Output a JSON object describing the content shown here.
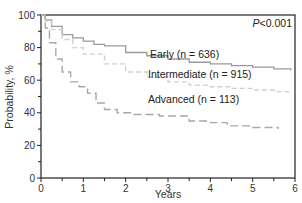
{
  "chart_data": {
    "type": "line",
    "title": "",
    "xlabel": "Years",
    "ylabel": "Probability, %",
    "xlim": [
      0,
      6
    ],
    "ylim": [
      0,
      100
    ],
    "x_ticks": [
      0,
      1,
      2,
      3,
      4,
      5,
      6
    ],
    "y_ticks": [
      0,
      20,
      40,
      60,
      80,
      100
    ],
    "grid": false,
    "annotation": "P<0.001",
    "series": [
      {
        "name": "Early (n = 636)",
        "label": "Early (n = 636)",
        "style": "solid",
        "color": "#9a9a9a",
        "x": [
          0,
          0.1,
          0.25,
          0.5,
          0.75,
          1.0,
          1.25,
          1.5,
          2.0,
          2.5,
          3.0,
          3.5,
          4.0,
          4.5,
          5.0,
          5.5,
          5.9
        ],
        "y": [
          100,
          97,
          93,
          88,
          86,
          84,
          82,
          81,
          77,
          75,
          73,
          71,
          70,
          69,
          68,
          67,
          66
        ]
      },
      {
        "name": "Intermediate (n = 915)",
        "label": "Intermediate (n = 915)",
        "style": "dashed",
        "color": "#d0d0d0",
        "x": [
          0,
          0.1,
          0.25,
          0.5,
          0.75,
          1.0,
          1.5,
          2.0,
          2.5,
          3.0,
          3.5,
          4.0,
          4.5,
          5.0,
          5.5,
          5.9
        ],
        "y": [
          100,
          96,
          91,
          85,
          80,
          76,
          70,
          65,
          62,
          59,
          57,
          56,
          55,
          54,
          53,
          53
        ]
      },
      {
        "name": "Advanced (n = 113)",
        "label": "Advanced (n = 113)",
        "style": "dashed",
        "color": "#a8a8a8",
        "x": [
          0,
          0.1,
          0.2,
          0.35,
          0.5,
          0.7,
          0.9,
          1.1,
          1.3,
          1.5,
          1.8,
          2.2,
          2.8,
          3.5,
          4.0,
          4.4,
          5.0,
          5.6
        ],
        "y": [
          100,
          92,
          83,
          73,
          65,
          59,
          56,
          52,
          46,
          42,
          40,
          39,
          38,
          35,
          34,
          32,
          31,
          30
        ]
      }
    ],
    "legend_position": "inline labels above curves"
  }
}
